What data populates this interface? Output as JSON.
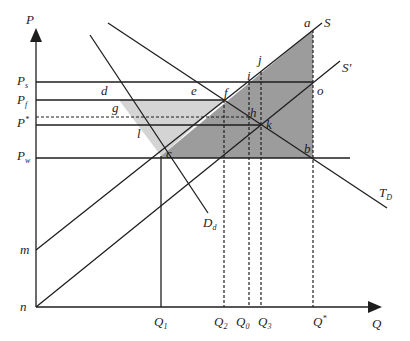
{
  "diagram": {
    "type": "economics supply-demand diagram",
    "axes": {
      "y_label": "P",
      "x_label": "Q",
      "origin_label": "n"
    },
    "y_ticks": [
      {
        "label": "P",
        "sub": "s",
        "y": 82
      },
      {
        "label": "P",
        "sub": "f",
        "y": 100
      },
      {
        "label": "P",
        "sub": "*",
        "y": 125
      },
      {
        "label": "P",
        "sub": "w",
        "y": 158
      },
      {
        "label": "m",
        "sub": "",
        "y": 250
      }
    ],
    "x_ticks": [
      {
        "label": "Q",
        "sub": "1",
        "x": 161
      },
      {
        "label": "Q",
        "sub": "2",
        "x": 224
      },
      {
        "label": "Q",
        "sub": "0",
        "x": 249
      },
      {
        "label": "Q",
        "sub": "3",
        "x": 261
      },
      {
        "label": "Q",
        "sub": "*",
        "x": 313
      }
    ],
    "curves": {
      "S": "S",
      "S_prime": "S'",
      "Dd": {
        "label": "D",
        "sub": "d"
      },
      "TD": {
        "label": "T",
        "sub": "D"
      }
    },
    "points": {
      "a": "a",
      "b": "b",
      "c": "c",
      "d": "d",
      "e": "e",
      "f": "f",
      "g": "g",
      "h": "h",
      "i": "i",
      "j": "j",
      "k": "k",
      "l": "l",
      "o": "o"
    },
    "colors": {
      "light_shade": "#d4d4d4",
      "dark_shade": "#9c9c9c",
      "line": "#1e1e1e"
    }
  }
}
